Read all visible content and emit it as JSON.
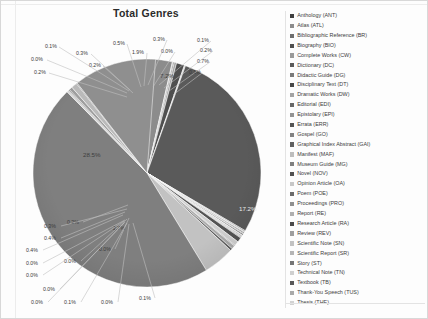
{
  "window": {
    "background_color": "#fdfdfd"
  },
  "chart_data": {
    "type": "pie",
    "title": "Total Genres",
    "xlabel": "",
    "ylabel": "",
    "legend_position": "right",
    "grid": false,
    "value_unit": "percent",
    "categories": [
      "Anthology (ANT)",
      "Atlas (ATL)",
      "Bibliographic Reference (BR)",
      "Biography  (BIO)",
      "Complete Works (CW)",
      "Dictionary (DC)",
      "Didactic Guide (DG)",
      "Disciplinary Text (DT)",
      "Dramatic Works (DW)",
      "Editorial (EDI)",
      "Epistolary (EPI)",
      "Errata (ERR)",
      "Gospel (GO)",
      "Graphical Index Abstract (GAI)",
      "Manifest (MAF)",
      "Museum Guide (MG)",
      "Novel (NOV)",
      "Opinion  Article (OA)",
      "Poem (POE)",
      "Proceedings (PRO)",
      "Report (RE)",
      "Research Article (RA)",
      "Review (REV)",
      "Scientific Note (SN)",
      "Scientific Report (SR)",
      "Story (ST)",
      "Technical Note (TN)",
      "Textbook (TB)",
      "Thank-You Speech (TUS)",
      "Thesis (THE)"
    ],
    "values": [
      0.3,
      1.9,
      0.0,
      0.1,
      0.2,
      0.7,
      0.1,
      17.2,
      0.1,
      0.0,
      0.1,
      0.0,
      0.1,
      0.0,
      0.0,
      0.0,
      0.0,
      0.4,
      0.4,
      0.0,
      0.3,
      0.2,
      2.7,
      28.5,
      0.2,
      0.0,
      0.3,
      0.5,
      0.0,
      7.2
    ],
    "slice_colors": [
      "#3f3f3f",
      "#8c8c8c",
      "#bdbdbd",
      "#6e6e6e",
      "#a3a3a3",
      "#4f4f4f",
      "#d2d2d2",
      "#5a5a5a",
      "#9a9a9a",
      "#c7c7c7",
      "#7a7a7a",
      "#afafaf",
      "#474747",
      "#dcdcdc",
      "#676767",
      "#b5b5b5",
      "#939393",
      "#545454",
      "#cfcfcf",
      "#828282",
      "#a9a9a9",
      "#606060",
      "#c2c2c2",
      "#7f7f7f",
      "#d7d7d7",
      "#515151",
      "#9e9e9e",
      "#bababa",
      "#6b6b6b",
      "#8f8f8f"
    ],
    "visible_labels_clockwise_from_top": [
      "0.3%",
      "1.9%",
      "0.0%",
      "0.1%",
      "0.2%",
      "0.7%",
      "0.1%",
      "17.2%",
      "7.2%",
      "0.1%",
      "0.0%",
      "0.1%",
      "0.0%",
      "0.0%",
      "0.0%",
      "0.0%",
      "0.4%",
      "0.4%",
      "0.0%",
      "0.3%",
      "0.2%",
      "2.7%",
      "28.5%",
      "0.2%",
      "0.0%",
      "0.3%",
      "0.5%"
    ],
    "callout_labels": {
      "top_left_cluster": [
        "0.1%",
        "0.0%",
        "0.2%",
        "0.3%",
        "0.2%"
      ],
      "top_center_cluster": [
        "0.5%",
        "0.3%",
        "1.9%",
        "0.0%"
      ],
      "top_right_cluster": [
        "0.1%",
        "0.2%",
        "0.7%",
        "0.1%"
      ],
      "left_major": "28.5%",
      "right_major": "17.2%",
      "upper_right_minor": "7.2%",
      "lower_left_cluster": [
        "0.3%",
        "0.2%",
        "0.4%",
        "0.4%",
        "0.0%",
        "0.0%",
        "2.7%"
      ],
      "bottom_cluster": [
        "0.0%",
        "0.0%",
        "0.0%",
        "0.0%",
        "0.1%",
        "0.0%",
        "0.1%"
      ]
    }
  },
  "legend": {
    "items": [
      {
        "label": "Anthology (ANT)",
        "color": "#3f3f3f"
      },
      {
        "label": "Atlas (ATL)",
        "color": "#8c8c8c"
      },
      {
        "label": "Bibliographic Reference (BR)",
        "color": "#6e6e6e"
      },
      {
        "label": "Biography  (BIO)",
        "color": "#4f4f4f"
      },
      {
        "label": "Complete Works (CW)",
        "color": "#9a9a9a"
      },
      {
        "label": "Dictionary (DC)",
        "color": "#5a5a5a"
      },
      {
        "label": "Didactic Guide (DG)",
        "color": "#7a7a7a"
      },
      {
        "label": "Disciplinary Text (DT)",
        "color": "#474747"
      },
      {
        "label": "Dramatic Works (DW)",
        "color": "#a3a3a3"
      },
      {
        "label": "Editorial (EDI)",
        "color": "#676767"
      },
      {
        "label": "Epistolary (EPI)",
        "color": "#939393"
      },
      {
        "label": "Errata (ERR)",
        "color": "#545454"
      },
      {
        "label": "Gospel (GO)",
        "color": "#828282"
      },
      {
        "label": "Graphical Index Abstract (GAI)",
        "color": "#606060"
      },
      {
        "label": "Manifest (MAF)",
        "color": "#bdbdbd"
      },
      {
        "label": "Museum Guide (MG)",
        "color": "#7f7f7f"
      },
      {
        "label": "Novel (NOV)",
        "color": "#515151"
      },
      {
        "label": "Opinion  Article (OA)",
        "color": "#c7c7c7"
      },
      {
        "label": "Poem (POE)",
        "color": "#6b6b6b"
      },
      {
        "label": "Proceedings (PRO)",
        "color": "#8f8f8f"
      },
      {
        "label": "Report (RE)",
        "color": "#afafaf"
      },
      {
        "label": "Research Article (RA)",
        "color": "#4a4a4a"
      },
      {
        "label": "Review (REV)",
        "color": "#9e9e9e"
      },
      {
        "label": "Scientific Note (SN)",
        "color": "#c2c2c2"
      },
      {
        "label": "Scientific Report (SR)",
        "color": "#b5b5b5"
      },
      {
        "label": "Story (ST)",
        "color": "#757575"
      },
      {
        "label": "Technical Note (TN)",
        "color": "#cfcfcf"
      },
      {
        "label": "Textbook (TB)",
        "color": "#585858"
      },
      {
        "label": "Thank-You Speech (TUS)",
        "color": "#a9a9a9"
      },
      {
        "label": "Thesis (THE)",
        "color": "#d2d2d2"
      }
    ]
  }
}
